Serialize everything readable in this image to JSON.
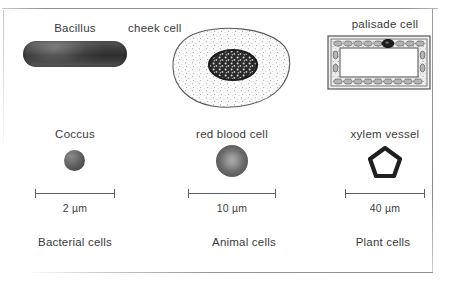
{
  "figure": {
    "background_color": "#ffffff",
    "frame_color": "#9a9a9a",
    "ink_color": "#3a3a3a"
  },
  "columns": [
    {
      "id": "bacterial",
      "category_label": "Bacterial cells",
      "cells": [
        {
          "id": "bacillus",
          "label": "Bacillus",
          "shape": "rod-capsule",
          "fill": "#3a3a3a"
        },
        {
          "id": "coccus",
          "label": "Coccus",
          "shape": "sphere",
          "fill": "#5a5a5a"
        }
      ],
      "scale": {
        "value": "2",
        "unit": "µm",
        "text": "2 µm",
        "bar_length_px": 80
      }
    },
    {
      "id": "animal",
      "category_label": "Animal cells",
      "cells": [
        {
          "id": "cheek-cell",
          "label": "cheek cell",
          "shape": "irregular-blob-with-nucleus",
          "fill": "#f4f4f4"
        },
        {
          "id": "red-blood-cell",
          "label": "red blood cell",
          "shape": "biconcave-disc",
          "fill": "#6f6f6f"
        }
      ],
      "scale": {
        "value": "10",
        "unit": "µm",
        "text": "10 µm",
        "bar_length_px": 88
      }
    },
    {
      "id": "plant",
      "category_label": "Plant cells",
      "cells": [
        {
          "id": "palisade-cell",
          "label": "palisade cell",
          "shape": "rectangle-with-cell-wall",
          "fill": "#ffffff"
        },
        {
          "id": "xylem-vessel",
          "label": "xylem vessel",
          "shape": "pentagon-outline",
          "fill": "#ffffff"
        }
      ],
      "scale": {
        "value": "40",
        "unit": "µm",
        "text": "40 µm",
        "bar_length_px": 80
      }
    }
  ]
}
